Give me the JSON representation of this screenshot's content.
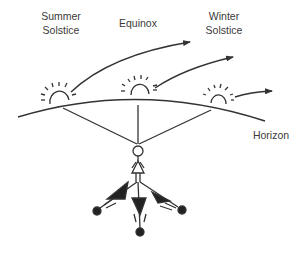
{
  "diagram": {
    "labels": {
      "summer_line1": "Summer",
      "summer_line2": "Solstice",
      "equinox": "Equinox",
      "winter_line1": "Winter",
      "winter_line2": "Solstice",
      "horizon": "Horizon"
    },
    "colors": {
      "stroke": "#333333",
      "text": "#3a3a3a",
      "background": "#ffffff"
    },
    "elements": {
      "suns": [
        "summer-solstice-sun",
        "equinox-sun",
        "winter-solstice-sun"
      ],
      "observer": "stick-figure-person",
      "shadows": [
        "summer-shadow",
        "equinox-shadow",
        "winter-shadow"
      ]
    }
  }
}
